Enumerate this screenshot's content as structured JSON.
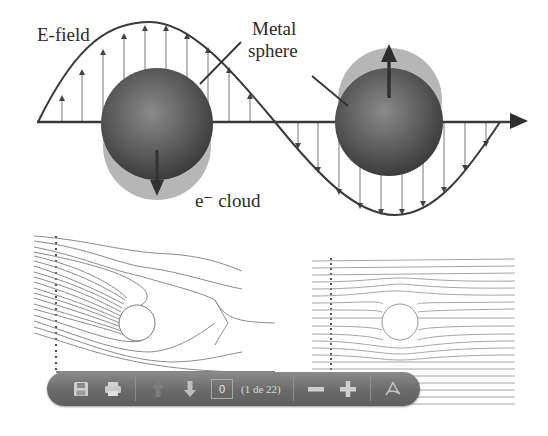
{
  "figure": {
    "labels": {
      "efield": "E-field",
      "metal_sphere_line1": "Metal",
      "metal_sphere_line2": "sphere",
      "e_cloud": "e⁻ cloud"
    },
    "colors": {
      "line": "#3a3a3a",
      "sphere": "#5a5a5a",
      "cloud": "#a8a8a8",
      "field_lines": "#8a8a8a",
      "toolbar": "#6e6e6e"
    }
  },
  "toolbar": {
    "buttons": [
      {
        "name": "save",
        "icon": "floppy-disk-icon"
      },
      {
        "name": "print",
        "icon": "printer-icon"
      },
      {
        "name": "previous-page",
        "icon": "arrow-up-icon",
        "disabled": true
      },
      {
        "name": "next-page",
        "icon": "arrow-down-icon"
      },
      {
        "name": "zoom-out",
        "icon": "minus-icon"
      },
      {
        "name": "zoom-in",
        "icon": "plus-icon"
      },
      {
        "name": "acrobat",
        "icon": "adobe-acrobat-icon"
      }
    ],
    "page_input_value": "0",
    "page_count_text": "(1 de 22)"
  }
}
